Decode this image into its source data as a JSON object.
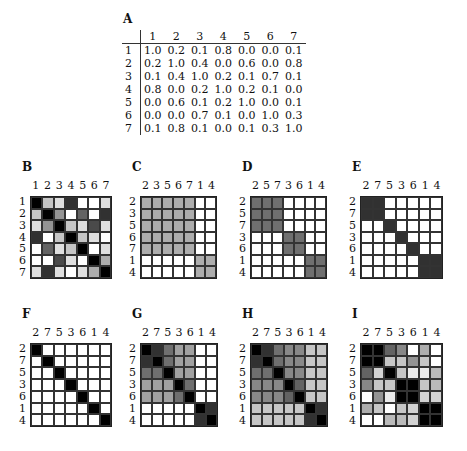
{
  "matrix_A": {
    "label": "A",
    "columns": [
      "1",
      "2",
      "3",
      "4",
      "5",
      "6",
      "7"
    ],
    "rows": [
      {
        "label": "1",
        "values": [
          "1.0",
          "0.2",
          "0.1",
          "0.8",
          "0.0",
          "0.0",
          "0.1"
        ]
      },
      {
        "label": "2",
        "values": [
          "0.2",
          "1.0",
          "0.4",
          "0.0",
          "0.6",
          "0.0",
          "0.8"
        ]
      },
      {
        "label": "3",
        "values": [
          "0.1",
          "0.4",
          "1.0",
          "0.2",
          "0.1",
          "0.7",
          "0.1"
        ]
      },
      {
        "label": "4",
        "values": [
          "0.8",
          "0.0",
          "0.2",
          "1.0",
          "0.2",
          "0.1",
          "0.0"
        ]
      },
      {
        "label": "5",
        "values": [
          "0.0",
          "0.6",
          "0.1",
          "0.2",
          "1.0",
          "0.0",
          "0.1"
        ]
      },
      {
        "label": "6",
        "values": [
          "0.0",
          "0.0",
          "0.7",
          "0.1",
          "0.0",
          "1.0",
          "0.3"
        ]
      },
      {
        "label": "7",
        "values": [
          "0.1",
          "0.8",
          "0.1",
          "0.0",
          "0.1",
          "0.3",
          "1.0"
        ]
      }
    ]
  },
  "panels": [
    {
      "label": "B",
      "x": 30,
      "y": 196,
      "w": 82,
      "h": 83,
      "order": [
        "1",
        "2",
        "3",
        "4",
        "5",
        "6",
        "7"
      ],
      "values": [
        [
          1.0,
          0.2,
          0.1,
          0.8,
          0.0,
          0.0,
          0.1
        ],
        [
          0.2,
          1.0,
          0.4,
          0.0,
          0.6,
          0.0,
          0.8
        ],
        [
          0.1,
          0.4,
          1.0,
          0.2,
          0.1,
          0.7,
          0.1
        ],
        [
          0.8,
          0.0,
          0.2,
          1.0,
          0.2,
          0.1,
          0.0
        ],
        [
          0.0,
          0.6,
          0.1,
          0.2,
          1.0,
          0.0,
          0.1
        ],
        [
          0.0,
          0.0,
          0.7,
          0.1,
          0.0,
          1.0,
          0.3
        ],
        [
          0.1,
          0.8,
          0.1,
          0.0,
          0.1,
          0.3,
          1.0
        ]
      ]
    },
    {
      "label": "C",
      "x": 140,
      "y": 196,
      "w": 77,
      "h": 83,
      "order": [
        "2",
        "3",
        "5",
        "6",
        "7",
        "1",
        "4"
      ],
      "values": [
        [
          0.3,
          0.3,
          0.3,
          0.3,
          0.3,
          0,
          0
        ],
        [
          0.3,
          0.3,
          0.3,
          0.3,
          0.3,
          0,
          0
        ],
        [
          0.3,
          0.3,
          0.3,
          0.3,
          0.3,
          0,
          0
        ],
        [
          0.3,
          0.3,
          0.3,
          0.3,
          0.3,
          0,
          0
        ],
        [
          0.3,
          0.3,
          0.3,
          0.3,
          0.3,
          0,
          0
        ],
        [
          0,
          0,
          0,
          0,
          0,
          0.3,
          0.3
        ],
        [
          0,
          0,
          0,
          0,
          0,
          0.3,
          0.3
        ]
      ]
    },
    {
      "label": "D",
      "x": 250,
      "y": 196,
      "w": 77,
      "h": 83,
      "order": [
        "2",
        "5",
        "7",
        "3",
        "6",
        "1",
        "4"
      ],
      "values": [
        [
          0.55,
          0.55,
          0.55,
          0,
          0,
          0,
          0
        ],
        [
          0.55,
          0.55,
          0.55,
          0,
          0,
          0,
          0
        ],
        [
          0.55,
          0.55,
          0.55,
          0,
          0,
          0,
          0
        ],
        [
          0,
          0,
          0,
          0.55,
          0.55,
          0,
          0
        ],
        [
          0,
          0,
          0,
          0.55,
          0.55,
          0,
          0
        ],
        [
          0,
          0,
          0,
          0,
          0,
          0.55,
          0.55
        ],
        [
          0,
          0,
          0,
          0,
          0,
          0.55,
          0.55
        ]
      ]
    },
    {
      "label": "E",
      "x": 360,
      "y": 196,
      "w": 83,
      "h": 83,
      "order": [
        "2",
        "7",
        "5",
        "3",
        "6",
        "1",
        "4"
      ],
      "values": [
        [
          0.8,
          0.8,
          0,
          0,
          0,
          0,
          0
        ],
        [
          0.8,
          0.8,
          0,
          0,
          0,
          0,
          0
        ],
        [
          0,
          0,
          0.8,
          0,
          0,
          0,
          0
        ],
        [
          0,
          0,
          0,
          0.8,
          0,
          0,
          0
        ],
        [
          0,
          0,
          0,
          0,
          0.8,
          0,
          0
        ],
        [
          0,
          0,
          0,
          0,
          0,
          0.8,
          0.8
        ],
        [
          0,
          0,
          0,
          0,
          0,
          0.8,
          0.8
        ]
      ]
    },
    {
      "label": "F",
      "x": 30,
      "y": 343,
      "w": 82,
      "h": 84,
      "order": [
        "2",
        "7",
        "5",
        "3",
        "6",
        "1",
        "4"
      ],
      "values": [
        [
          1,
          0,
          0,
          0,
          0,
          0,
          0
        ],
        [
          0,
          1,
          0,
          0,
          0,
          0,
          0
        ],
        [
          0,
          0,
          1,
          0,
          0,
          0,
          0
        ],
        [
          0,
          0,
          0,
          1,
          0,
          0,
          0
        ],
        [
          0,
          0,
          0,
          0,
          1,
          0,
          0
        ],
        [
          0,
          0,
          0,
          0,
          0,
          1,
          0
        ],
        [
          0,
          0,
          0,
          0,
          0,
          0,
          1
        ]
      ]
    },
    {
      "label": "G",
      "x": 140,
      "y": 343,
      "w": 78,
      "h": 84,
      "order": [
        "2",
        "7",
        "5",
        "3",
        "6",
        "1",
        "4"
      ],
      "values": [
        [
          1.0,
          0.8,
          0.55,
          0.35,
          0.35,
          0,
          0
        ],
        [
          0.8,
          1.0,
          0.55,
          0.35,
          0.35,
          0,
          0
        ],
        [
          0.55,
          0.55,
          1.0,
          0.35,
          0.35,
          0,
          0
        ],
        [
          0.35,
          0.35,
          0.35,
          1.0,
          0.55,
          0,
          0
        ],
        [
          0.35,
          0.35,
          0.35,
          0.55,
          1.0,
          0,
          0
        ],
        [
          0,
          0,
          0,
          0,
          0,
          1.0,
          0.8
        ],
        [
          0,
          0,
          0,
          0,
          0,
          0.8,
          1.0
        ]
      ]
    },
    {
      "label": "H",
      "x": 250,
      "y": 343,
      "w": 78,
      "h": 84,
      "order": [
        "2",
        "7",
        "5",
        "3",
        "6",
        "1",
        "4"
      ],
      "values": [
        [
          1.0,
          0.8,
          0.55,
          0.45,
          0.45,
          0.2,
          0.2
        ],
        [
          0.8,
          1.0,
          0.55,
          0.45,
          0.45,
          0.2,
          0.2
        ],
        [
          0.55,
          0.55,
          1.0,
          0.45,
          0.45,
          0.2,
          0.2
        ],
        [
          0.45,
          0.45,
          0.45,
          1.0,
          0.6,
          0.2,
          0.2
        ],
        [
          0.45,
          0.45,
          0.45,
          0.6,
          1.0,
          0.2,
          0.2
        ],
        [
          0.2,
          0.2,
          0.2,
          0.2,
          0.2,
          1.0,
          0.8
        ],
        [
          0.2,
          0.2,
          0.2,
          0.2,
          0.2,
          0.8,
          1.0
        ]
      ]
    },
    {
      "label": "I",
      "x": 360,
      "y": 343,
      "w": 83,
      "h": 84,
      "order": [
        "2",
        "7",
        "5",
        "3",
        "6",
        "1",
        "4"
      ],
      "values": [
        [
          1.0,
          1.0,
          0.6,
          0.45,
          0.0,
          0.3,
          0.0
        ],
        [
          1.0,
          1.0,
          0.2,
          0.2,
          0.4,
          0.2,
          0.0
        ],
        [
          0.6,
          0.15,
          1.0,
          0.2,
          0.05,
          0.05,
          0.25
        ],
        [
          0.45,
          0.2,
          0.2,
          1.0,
          1.0,
          0.2,
          0.25
        ],
        [
          0.0,
          0.4,
          0.05,
          1.0,
          1.0,
          0.15,
          0.15
        ],
        [
          0.3,
          0.2,
          0.0,
          0.2,
          0.15,
          1.0,
          1.0
        ],
        [
          0.0,
          0.0,
          0.25,
          0.25,
          0.15,
          1.0,
          1.0
        ]
      ]
    }
  ]
}
